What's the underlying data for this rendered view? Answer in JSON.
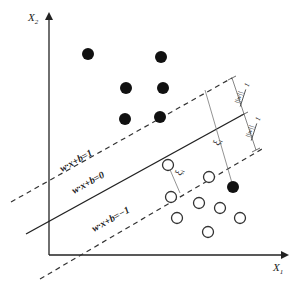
{
  "diagram": {
    "axes": {
      "x_label": "X",
      "x_sub": "1",
      "y_label": "X",
      "y_sub": "2",
      "color": "#222222"
    },
    "lines": {
      "upper_margin": {
        "label": "w·x+b=1",
        "style": "dashed"
      },
      "hyperplane": {
        "label": "w·x+b=0",
        "style": "solid"
      },
      "lower_margin": {
        "label": "w·x+b=−1",
        "style": "dashed"
      }
    },
    "margin_labels": {
      "upper": {
        "numerator": "1",
        "denominator": "||w||"
      },
      "lower": {
        "numerator": "1",
        "denominator": "||w||"
      }
    },
    "slack_labels": {
      "slack_1": "ξ",
      "slack_1_sub": "i",
      "slack_2": "ξ",
      "slack_2_sub": "i"
    },
    "points": {
      "filled_color": "#111111",
      "hollow_stroke": "#333333",
      "filled": [
        {
          "x": 88,
          "y": 54
        },
        {
          "x": 161,
          "y": 57
        },
        {
          "x": 126,
          "y": 88
        },
        {
          "x": 163,
          "y": 88
        },
        {
          "x": 125,
          "y": 119
        },
        {
          "x": 160,
          "y": 117
        },
        {
          "x": 233,
          "y": 187
        }
      ],
      "hollow": [
        {
          "x": 168,
          "y": 165
        },
        {
          "x": 209,
          "y": 177
        },
        {
          "x": 171,
          "y": 197
        },
        {
          "x": 199,
          "y": 203
        },
        {
          "x": 220,
          "y": 208
        },
        {
          "x": 177,
          "y": 218
        },
        {
          "x": 240,
          "y": 218
        },
        {
          "x": 208,
          "y": 232
        }
      ]
    }
  }
}
